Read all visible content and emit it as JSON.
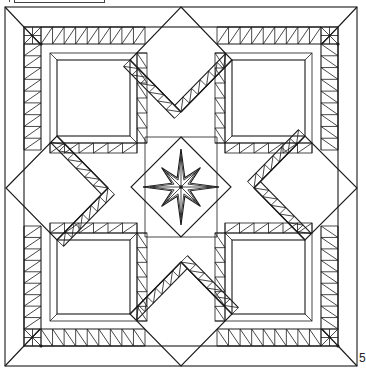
{
  "figure": {
    "page_number": "5",
    "colors": {
      "line": "#1a1a1a",
      "background": "#ffffff"
    }
  },
  "geometry": {
    "outer_border": [
      5,
      7,
      357,
      366
    ],
    "inner_frame": [
      24,
      27,
      338,
      346
    ],
    "center": [
      181,
      187
    ],
    "diamonds": [
      {
        "name": "top",
        "points": [
          [
            181,
            7
          ],
          [
            232,
            60
          ],
          [
            181,
            112
          ],
          [
            130,
            60
          ]
        ]
      },
      {
        "name": "bottom",
        "points": [
          [
            181,
            262
          ],
          [
            232,
            314
          ],
          [
            181,
            366
          ],
          [
            130,
            314
          ]
        ]
      },
      {
        "name": "left",
        "points": [
          [
            6,
            188
          ],
          [
            57,
            136
          ],
          [
            108,
            188
          ],
          [
            57,
            240
          ]
        ]
      },
      {
        "name": "right",
        "points": [
          [
            254,
            188
          ],
          [
            305,
            136
          ],
          [
            357,
            188
          ],
          [
            305,
            240
          ]
        ]
      }
    ],
    "plain_squares": [
      {
        "name": "top-left",
        "rect": [
          57,
          60,
          73,
          76
        ]
      },
      {
        "name": "top-right",
        "rect": [
          232,
          60,
          73,
          76
        ]
      },
      {
        "name": "bottom-left",
        "rect": [
          57,
          240,
          73,
          74
        ]
      },
      {
        "name": "bottom-right",
        "rect": [
          232,
          240,
          73,
          74
        ]
      }
    ],
    "center_star": {
      "outer_radius": 38,
      "inner_radius": 10,
      "points": 8
    }
  }
}
